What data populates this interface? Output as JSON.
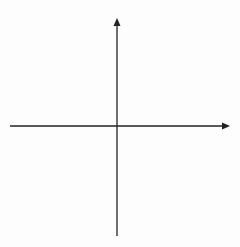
{
  "diagram": {
    "type": "coordinate-plane",
    "x_axis_label": "x",
    "y_axis_label": "y",
    "x_min": -7,
    "x_max": 7,
    "y_min": -7,
    "y_max": 7,
    "x_ticks": [
      "-6",
      "-5",
      "-4",
      "-3",
      "-2",
      "-1",
      "0",
      "1",
      "2",
      "3",
      "4",
      "5",
      "6"
    ],
    "y_ticks": [
      "6",
      "5",
      "4",
      "3",
      "2",
      "1",
      "-1",
      "-2",
      "-3",
      "-4",
      "-5",
      "-6"
    ],
    "origin_label": "0",
    "colors": {
      "grid": "#a8a8a8",
      "axis": "#222222",
      "background": "#fdfdfd"
    }
  }
}
